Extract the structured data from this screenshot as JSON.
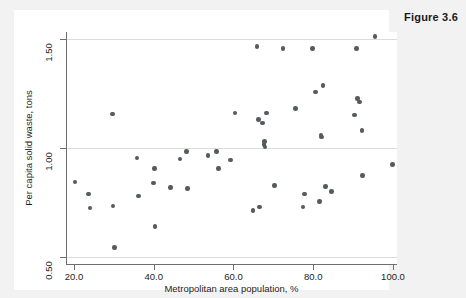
{
  "figure": {
    "caption": "Figure 3.6"
  },
  "colors": {
    "page_background": "#f2f2f2",
    "panel_background": "#ffffff",
    "marker": "#555a5e",
    "gridline": "#dcdcdc",
    "axis": "#6e6e6e",
    "text": "#1d1d1d"
  },
  "chart_data": {
    "type": "scatter",
    "title": "Figure 3.6",
    "xlabel": "Metropolitan area population, %",
    "ylabel": "Per capita solid waste, tons",
    "xlim": [
      18.0,
      101.0
    ],
    "ylim": [
      0.47,
      1.53
    ],
    "xticks": [
      20.0,
      40.0,
      60.0,
      80.0,
      100.0
    ],
    "xtick_labels": [
      "20.0",
      "40.0",
      "60.0",
      "80.0",
      "100.0"
    ],
    "yticks": [
      0.5,
      1.0,
      1.5
    ],
    "ytick_labels": [
      "0.50",
      "1.00",
      "1.50"
    ],
    "grid": "horizontal",
    "legend": "none",
    "marker_size": 4.6,
    "n_points": 62,
    "points": [
      {
        "x": 20.3,
        "y": 0.845
      },
      {
        "x": 23.6,
        "y": 0.79
      },
      {
        "x": 24.0,
        "y": 0.725
      },
      {
        "x": 29.6,
        "y": 1.155
      },
      {
        "x": 29.8,
        "y": 0.735
      },
      {
        "x": 30.1,
        "y": 0.545
      },
      {
        "x": 35.8,
        "y": 0.955
      },
      {
        "x": 36.2,
        "y": 0.78
      },
      {
        "x": 39.9,
        "y": 0.84
      },
      {
        "x": 40.2,
        "y": 0.905
      },
      {
        "x": 40.3,
        "y": 0.64
      },
      {
        "x": 44.2,
        "y": 0.82
      },
      {
        "x": 46.6,
        "y": 0.95
      },
      {
        "x": 48.2,
        "y": 0.985
      },
      {
        "x": 48.5,
        "y": 0.815
      },
      {
        "x": 53.6,
        "y": 0.965
      },
      {
        "x": 55.8,
        "y": 0.985
      },
      {
        "x": 56.2,
        "y": 0.905
      },
      {
        "x": 59.3,
        "y": 0.945
      },
      {
        "x": 60.4,
        "y": 1.16
      },
      {
        "x": 64.9,
        "y": 0.715
      },
      {
        "x": 65.9,
        "y": 1.465
      },
      {
        "x": 66.2,
        "y": 1.13
      },
      {
        "x": 66.5,
        "y": 0.73
      },
      {
        "x": 67.3,
        "y": 1.115
      },
      {
        "x": 67.6,
        "y": 1.015
      },
      {
        "x": 67.8,
        "y": 1.03
      },
      {
        "x": 67.9,
        "y": 1.005
      },
      {
        "x": 68.3,
        "y": 1.16
      },
      {
        "x": 70.3,
        "y": 0.83
      },
      {
        "x": 72.4,
        "y": 1.455
      },
      {
        "x": 75.6,
        "y": 1.18
      },
      {
        "x": 77.4,
        "y": 0.73
      },
      {
        "x": 77.8,
        "y": 0.79
      },
      {
        "x": 79.8,
        "y": 1.455
      },
      {
        "x": 80.6,
        "y": 1.255
      },
      {
        "x": 81.5,
        "y": 0.755
      },
      {
        "x": 81.9,
        "y": 1.06
      },
      {
        "x": 82.1,
        "y": 1.05
      },
      {
        "x": 82.4,
        "y": 1.285
      },
      {
        "x": 83.1,
        "y": 0.825
      },
      {
        "x": 84.6,
        "y": 0.8
      },
      {
        "x": 90.4,
        "y": 1.15
      },
      {
        "x": 90.8,
        "y": 1.455
      },
      {
        "x": 91.1,
        "y": 1.225
      },
      {
        "x": 91.6,
        "y": 1.21
      },
      {
        "x": 92.2,
        "y": 1.08
      },
      {
        "x": 92.4,
        "y": 0.875
      },
      {
        "x": 95.5,
        "y": 1.51
      },
      {
        "x": 99.8,
        "y": 0.925
      }
    ]
  }
}
